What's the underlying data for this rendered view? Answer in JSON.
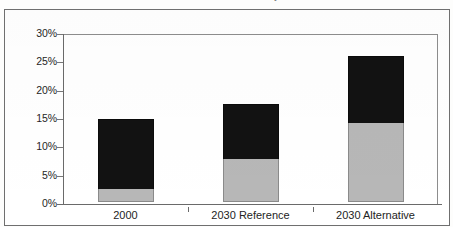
{
  "figure": {
    "title": "in the Reference and Alternative Policy Scenarios"
  },
  "chart_data": {
    "type": "bar",
    "stacked": true,
    "title": "in the Reference and Alternative Policy Scenarios",
    "xlabel": "",
    "ylabel": "",
    "categories": [
      "2000",
      "2030 Reference",
      "2030 Alternative"
    ],
    "ylim": [
      0,
      30
    ],
    "yticks": [
      0,
      5,
      10,
      15,
      20,
      25,
      30
    ],
    "ytick_labels": [
      "0%",
      "5%",
      "10%",
      "15%",
      "20%",
      "25%",
      "30%"
    ],
    "ytick_format": "percent",
    "grid": false,
    "legend": "none",
    "series": [
      {
        "name": "lower-segment",
        "color": "#b7b7b7",
        "values": [
          2.3,
          7.6,
          14.0
        ]
      },
      {
        "name": "upper-segment",
        "color": "#121212",
        "values": [
          12.3,
          9.7,
          11.8
        ]
      }
    ],
    "totals": [
      14.6,
      17.3,
      25.8
    ]
  },
  "axis": {
    "y_labels": [
      "30%",
      "25%",
      "20%",
      "15%",
      "10%",
      "5%",
      "0%"
    ],
    "x_labels": [
      "2000",
      "2030 Reference",
      "2030 Alternative"
    ]
  }
}
